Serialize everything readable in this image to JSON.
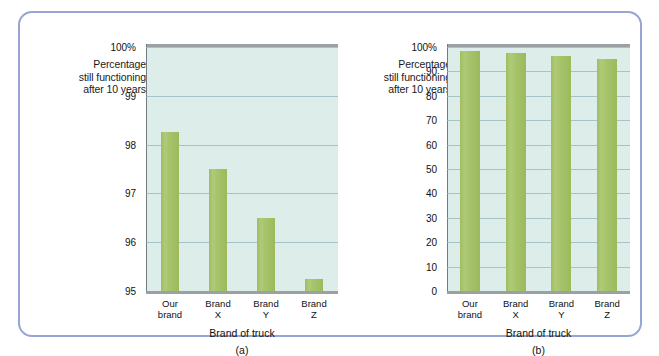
{
  "figure": {
    "frame_color": "#97a4d6",
    "background": "#ffffff",
    "plot_background": "#ddeeea",
    "bar_color": "#a6c268",
    "gridline_color": "#93b4bb",
    "axis_rule_color": "#9aa0a4"
  },
  "chart_data": [
    {
      "type": "bar",
      "panel": "a",
      "caption": "(a)",
      "title": "",
      "ylabel_lines": [
        "Percentage",
        "still functioning",
        "after 10 years"
      ],
      "xlabel": "Brand of truck",
      "categories": [
        "Our\nbrand",
        "Brand\nX",
        "Brand\nY",
        "Brand\nZ"
      ],
      "category_labels_flat": [
        "Our brand",
        "Brand X",
        "Brand Y",
        "Brand Z"
      ],
      "values": [
        98.25,
        97.5,
        96.5,
        95.25
      ],
      "ylim": [
        95,
        100
      ],
      "yticks": [
        95,
        96,
        97,
        98,
        99,
        100
      ],
      "ytick_labels": [
        "95",
        "96",
        "97",
        "98",
        "99",
        "100%"
      ],
      "grid": true,
      "legend": "none"
    },
    {
      "type": "bar",
      "panel": "b",
      "caption": "(b)",
      "title": "",
      "ylabel_lines": [
        "Percentage",
        "still functioning",
        "after 10 years"
      ],
      "xlabel": "Brand of truck",
      "categories": [
        "Our\nbrand",
        "Brand\nX",
        "Brand\nY",
        "Brand\nZ"
      ],
      "category_labels_flat": [
        "Our brand",
        "Brand X",
        "Brand Y",
        "Brand Z"
      ],
      "values": [
        98.25,
        97.5,
        96.5,
        95.25
      ],
      "ylim": [
        0,
        100
      ],
      "yticks": [
        0,
        10,
        20,
        30,
        40,
        50,
        60,
        70,
        80,
        90,
        100
      ],
      "ytick_labels": [
        "0",
        "10",
        "20",
        "30",
        "40",
        "50",
        "60",
        "70",
        "80",
        "90",
        "100%"
      ],
      "grid": true,
      "legend": "none"
    }
  ]
}
